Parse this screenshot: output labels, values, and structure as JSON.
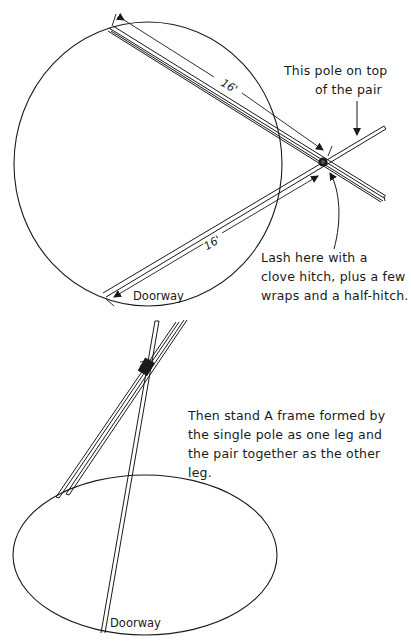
{
  "figure": {
    "background": "#ffffff",
    "ink_color": "#1a1a1a"
  },
  "top_view": {
    "dimension_pair": "16'",
    "dimension_single": "16'",
    "callout_top": {
      "line1": "This pole on top",
      "line2": "of the pair"
    },
    "callout_lash": {
      "line1": "Lash here with a",
      "line2": "clove hitch, plus a few",
      "line3": "wraps and a half-hitch."
    },
    "doorway_label": "Doorway"
  },
  "raised_view": {
    "instruction": {
      "line1": "Then stand A frame formed by",
      "line2": "the single pole as one leg and",
      "line3": "the pair together as the other",
      "line4": "leg."
    },
    "doorway_label": "Doorway"
  }
}
